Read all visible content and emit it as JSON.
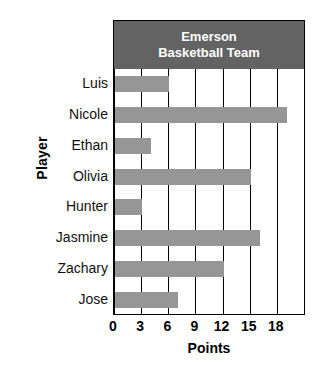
{
  "chart_data": {
    "type": "bar",
    "orientation": "horizontal",
    "title": "Emerson Basketball Team",
    "title_lines": [
      "Emerson",
      "Basketball Team"
    ],
    "xlabel": "Points",
    "ylabel": "Player",
    "categories": [
      "Luis",
      "Nicole",
      "Ethan",
      "Olivia",
      "Hunter",
      "Jasmine",
      "Zachary",
      "Jose"
    ],
    "values": [
      6,
      19,
      4,
      15,
      3,
      16,
      12,
      7
    ],
    "xlim": [
      0,
      21
    ],
    "xticks": [
      0,
      3,
      6,
      9,
      12,
      15,
      18
    ],
    "xtick_labels": [
      "0",
      "3",
      "6",
      "9",
      "12",
      "15",
      "18"
    ],
    "gridline_positions": [
      0,
      3,
      6,
      9,
      12,
      15,
      18,
      21
    ],
    "grid": true,
    "legend": "none",
    "bar_color": "#969696",
    "title_background_color": "#636363",
    "title_text_color": "#ffffff",
    "axis_color": "#000000",
    "plot_background_color": "#ffffff"
  }
}
